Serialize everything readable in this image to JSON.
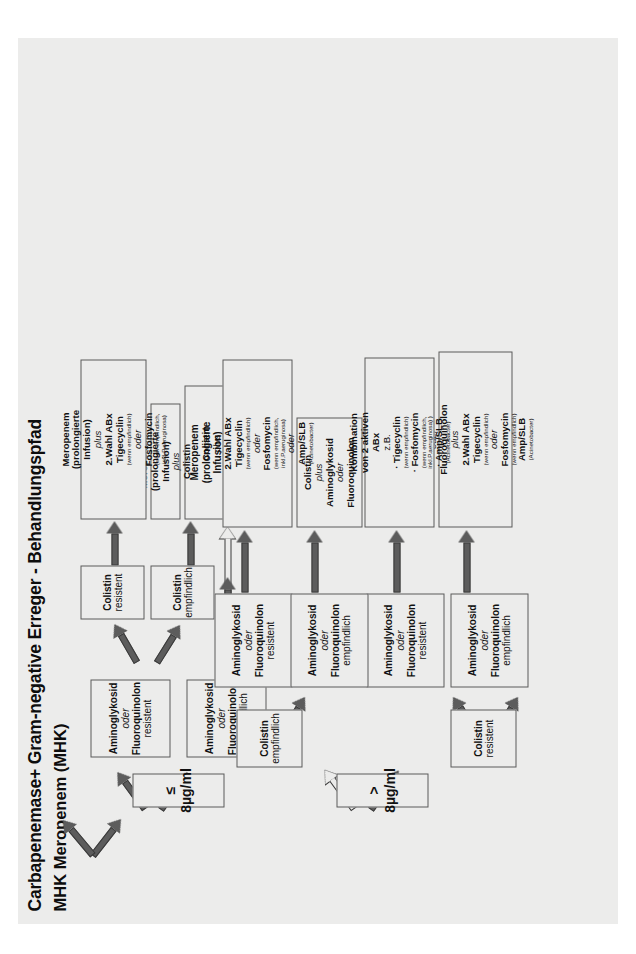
{
  "title": "Carbapenemase+ Gram-negative Erreger - Behandlungspfad",
  "subtitle": "MHK Meropenem (MHK)",
  "branches": {
    "low": "≤ 8µg/ml",
    "high": "> 8µg/ml"
  },
  "labels": {
    "aminoglykosid": "Aminoglykosid",
    "oder": "oder",
    "plus": "plus",
    "fluoroquinolon": "Fluoroquinolon",
    "empfindlich": "empfindlich",
    "resistent": "resistent",
    "colistin": "Colistin",
    "meropenem": "Meropenem",
    "prolongierte": "(prolongierte",
    "infusion": "Infusion)",
    "wahl_abx": "2.Wahl ABx",
    "tigecyclin": "Tigecyclin",
    "fosfomycin": "Fosfomycin",
    "amp_slb": "Amp/SLB",
    "wenn_empfindlich": "(wenn empfindlich)",
    "wenn_empfindlich_pa": "(wenn empfindlich,",
    "inkl_pa": "inkl.P.aeruginosa)",
    "inkl_pa_close": "inkl.P.aeruginosa) )",
    "acinetobacter": "(Acinetobacter)",
    "kombination": "Kombination",
    "von2aktiven": "von 2 aktiven",
    "abx": "ABx",
    "zb": "z.B.",
    "bullet_tigecyclin": "· Tigecyclin",
    "bullet_fosfomycin": "· Fosfomycin",
    "bullet_ampslb": "· Amp/SLB"
  },
  "nodes": {
    "n_low_amino_emp": [
      "Aminoglykosid",
      "oder",
      "Fluoroquinolon",
      "empfindlich"
    ],
    "n_low_amino_res": [
      "Aminoglykosid",
      "oder",
      "Fluoroquinolon",
      "resistent"
    ],
    "n_low_col_emp": [
      "Colistin",
      "empfindlich"
    ],
    "n_low_col_res": [
      "Colistin",
      "resistent"
    ],
    "n_high_col_emp": [
      "Colistin",
      "empfindlich"
    ],
    "n_high_col_res": [
      "Colistin",
      "resistent"
    ],
    "n_high_ce_amino_emp": [
      "Aminoglykosid",
      "oder",
      "Fluoroquinolon",
      "empfindlich"
    ],
    "n_high_ce_amino_res": [
      "Aminoglykosid",
      "oder",
      "Fluoroquinolon",
      "resistent"
    ],
    "n_high_cr_amino_emp": [
      "Aminoglykosid",
      "oder",
      "Fluoroquinolon",
      "empfindlich"
    ],
    "n_high_cr_amino_res": [
      "Aminoglykosid",
      "oder",
      "Fluoroquinolon",
      "resistent"
    ]
  },
  "outcomes": {
    "o1": {
      "lines": [
        {
          "t": "Meropenem",
          "s": "b"
        },
        {
          "t": "(prolongierte",
          "s": "b"
        },
        {
          "t": "Infusion)",
          "s": "b"
        },
        {
          "t": "plus",
          "s": "it"
        },
        {
          "t": "Aminoglykosid",
          "s": "b"
        },
        {
          "t": "oder",
          "s": "it"
        },
        {
          "t": "Fluoroquinolon",
          "s": "b"
        }
      ]
    },
    "o2": {
      "lines": [
        {
          "t": "Meropenem",
          "s": "b"
        },
        {
          "t": "(prolongierte",
          "s": "b"
        },
        {
          "t": "Infusion)",
          "s": "b"
        },
        {
          "t": "plus",
          "s": "it"
        },
        {
          "t": "Colistin",
          "s": "b"
        }
      ]
    },
    "o3": {
      "lines": [
        {
          "t": "Meropenem",
          "s": "b"
        },
        {
          "t": "(prolongierte",
          "s": "b"
        },
        {
          "t": "Infusion)",
          "s": "b"
        },
        {
          "t": "plus",
          "s": "it"
        },
        {
          "t": "2.Wahl ABx",
          "s": "b"
        },
        {
          "t": "Tigecyclin",
          "s": "b"
        },
        {
          "t": "(wenn empfindlich)",
          "s": "sm"
        },
        {
          "t": "oder",
          "s": "it"
        },
        {
          "t": "Fosfomycin",
          "s": "b"
        },
        {
          "t": "(wenn empfindlich,",
          "s": "sm"
        },
        {
          "t": "inkl.P.aeruginosa)",
          "s": "sm"
        }
      ]
    },
    "o4": {
      "lines": [
        {
          "t": "Colistin",
          "s": "b"
        },
        {
          "t": "plus",
          "s": "it"
        },
        {
          "t": "Aminoglykosid",
          "s": "b"
        },
        {
          "t": "oder",
          "s": "it"
        },
        {
          "t": "Fluoroquinolon",
          "s": "b"
        }
      ]
    },
    "o5": {
      "lines": [
        {
          "t": "Colistin",
          "s": "b"
        },
        {
          "t": "plus",
          "s": "it"
        },
        {
          "t": "2.Wahl ABx",
          "s": "b"
        },
        {
          "t": "Tigecyclin",
          "s": "b"
        },
        {
          "t": "(wenn empfindlich)",
          "s": "sm"
        },
        {
          "t": "oder",
          "s": "it"
        },
        {
          "t": "Fosfomycin",
          "s": "b"
        },
        {
          "t": "(wenn empfindlich,",
          "s": "sm"
        },
        {
          "t": "inkl.P.aeruginosa)",
          "s": "sm"
        },
        {
          "t": "oder",
          "s": "it"
        },
        {
          "t": "Amp/SLB",
          "s": "b"
        },
        {
          "t": "(Acinetobacter)",
          "s": "sm"
        }
      ]
    },
    "o6": {
      "lines": [
        {
          "t": "Aminoglykosid",
          "s": "b"
        },
        {
          "t": "oder",
          "s": "it"
        },
        {
          "t": "Fluoroquinolon",
          "s": "b"
        },
        {
          "t": "plus",
          "s": "it"
        },
        {
          "t": "2.Wahl ABx",
          "s": "b"
        },
        {
          "t": "Tigecyclin",
          "s": "b"
        },
        {
          "t": "(wenn empfindlich)",
          "s": "sm"
        },
        {
          "t": "oder",
          "s": "it"
        },
        {
          "t": "Fosfomycin",
          "s": "b"
        },
        {
          "t": "(wenn empfindlich)",
          "s": "sm"
        },
        {
          "t": "Amp/SLB",
          "s": "b"
        },
        {
          "t": "(Acinetobacter)",
          "s": "sm"
        }
      ]
    },
    "o7": {
      "lines": [
        {
          "t": "Kombination",
          "s": "b"
        },
        {
          "t": "von 2 aktiven",
          "s": "b"
        },
        {
          "t": "ABx",
          "s": "b"
        },
        {
          "t": "z.B.",
          "s": "plain"
        },
        {
          "t": "· Tigecyclin",
          "s": "b"
        },
        {
          "t": "(wenn empfindlich)",
          "s": "sm"
        },
        {
          "t": "· Fosfomycin",
          "s": "b"
        },
        {
          "t": "(wenn empfindlich,",
          "s": "sm"
        },
        {
          "t": "inkl.P.aeruginosa) )",
          "s": "sm"
        },
        {
          "t": "· Amp/SLB",
          "s": "b"
        },
        {
          "t": "(Acinetobacter)",
          "s": "sm"
        }
      ]
    }
  }
}
